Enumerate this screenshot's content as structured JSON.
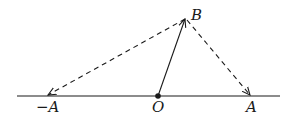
{
  "diagram": {
    "type": "vector-diagram",
    "stroke_color": "#1a1a1a",
    "background": "#ffffff",
    "baseline": {
      "x1": 17,
      "y": 96,
      "x2": 280
    },
    "points": {
      "O": {
        "label": "O",
        "x": 158,
        "y": 96
      },
      "B": {
        "label": "B",
        "x": 185,
        "y": 18
      },
      "A": {
        "label": "A",
        "x": 251,
        "y": 96
      },
      "negA": {
        "label": "−A",
        "x": 47,
        "y": 96
      }
    },
    "vectors": [
      {
        "from": "O",
        "to": "B",
        "style": "solid"
      },
      {
        "from": "B",
        "to": "negA",
        "style": "dashed"
      },
      {
        "from": "B",
        "to": "A",
        "style": "dashed"
      }
    ]
  }
}
